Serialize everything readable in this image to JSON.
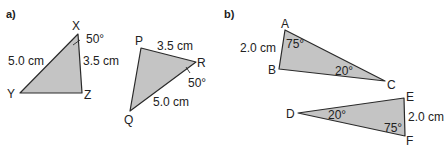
{
  "parts": {
    "a": "a)",
    "b": "b)"
  },
  "colors": {
    "fill": "#c4c4c4",
    "stroke": "#2a2a2a",
    "text": "#222222"
  },
  "triangles": {
    "XYZ": {
      "vertices": {
        "X": "X",
        "Y": "Y",
        "Z": "Z"
      },
      "side_XY": "5.0 cm",
      "side_XZ": "3.5 cm",
      "angle_X": "50°"
    },
    "PQR": {
      "vertices": {
        "P": "P",
        "Q": "Q",
        "R": "R"
      },
      "side_PR": "3.5 cm",
      "side_QR": "5.0 cm",
      "angle_R": "50°"
    },
    "ABC": {
      "vertices": {
        "A": "A",
        "B": "B",
        "C": "C"
      },
      "side_AB": "2.0 cm",
      "angle_A": "75°",
      "angle_C": "20°"
    },
    "DEF": {
      "vertices": {
        "D": "D",
        "E": "E",
        "F": "F"
      },
      "side_EF": "2.0 cm",
      "angle_D": "20°",
      "angle_F": "75°"
    }
  }
}
